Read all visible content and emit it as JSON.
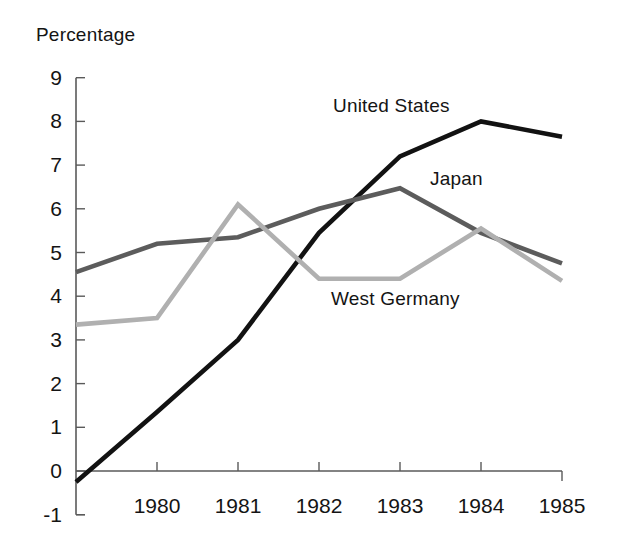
{
  "chart_data": {
    "type": "line",
    "title": "",
    "ylabel": "Percentage",
    "xlabel": "",
    "grid": false,
    "legend_position": "inline-annotations",
    "x": [
      1979,
      1980,
      1981,
      1982,
      1983,
      1984,
      1985
    ],
    "xtick_labels": [
      "1980",
      "1981",
      "1982",
      "1983",
      "1984",
      "1985"
    ],
    "xtick_values": [
      1980,
      1981,
      1982,
      1983,
      1984,
      1985
    ],
    "ytick_labels": [
      "9",
      "8",
      "7",
      "6",
      "5",
      "4",
      "3",
      "2",
      "1",
      "0",
      "-1"
    ],
    "ytick_values": [
      9,
      8,
      7,
      6,
      5,
      4,
      3,
      2,
      1,
      0,
      -1
    ],
    "ylim": [
      -1,
      9
    ],
    "xlim": [
      1979,
      1985
    ],
    "series": [
      {
        "name": "United States",
        "color": "#121212",
        "values": [
          -0.25,
          1.35,
          3.0,
          5.45,
          7.2,
          8.0,
          7.65
        ]
      },
      {
        "name": "Japan",
        "color": "#5c5c5c",
        "values": [
          4.55,
          5.2,
          5.35,
          6.0,
          6.47,
          5.45,
          4.75
        ]
      },
      {
        "name": "West Germany",
        "color": "#b0b0b0",
        "values": [
          3.35,
          3.5,
          6.1,
          4.4,
          4.4,
          5.55,
          4.35
        ]
      }
    ],
    "annotations": [
      {
        "text": "United States",
        "x_px": 333,
        "y_px": 95
      },
      {
        "text": "Japan",
        "x_px": 430,
        "y_px": 168
      },
      {
        "text": "West Germany",
        "x_px": 331,
        "y_px": 288
      }
    ]
  },
  "axis": {
    "y_label_text": "Percentage"
  }
}
